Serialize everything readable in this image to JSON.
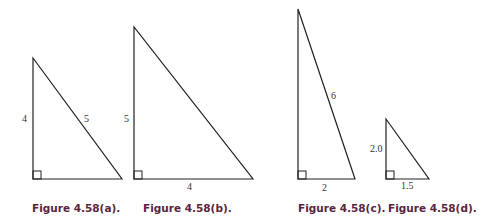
{
  "figures": [
    {
      "id": "a",
      "caption": "Figure 4.58(a).",
      "vertical_label": "4",
      "hypotenuse_label": "5",
      "base_label": ""
    },
    {
      "id": "b",
      "caption": "Figure 4.58(b).",
      "vertical_label": "5",
      "hypotenuse_label": "",
      "base_label": "4"
    },
    {
      "id": "c",
      "caption": "Figure 4.58(c).",
      "vertical_label": "",
      "hypotenuse_label": "6",
      "base_label": "2"
    },
    {
      "id": "d",
      "caption": "Figure 4.58(d).",
      "vertical_label": "2.0",
      "hypotenuse_label": "",
      "base_label": "1.5"
    }
  ],
  "colors": {
    "line": "#222222",
    "caption": "#5a2540"
  }
}
